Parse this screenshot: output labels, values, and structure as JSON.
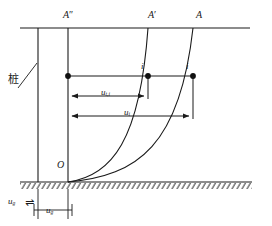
{
  "figure": {
    "colors": {
      "line": "#1a1a1a",
      "curve": "#1a1a1a",
      "dot": "#101010",
      "hatch": "#2a2a2a",
      "background": "#ffffff"
    }
  },
  "labels": {
    "pile_cjk": "桩",
    "origin": "O",
    "top_ref": {
      "base": "A",
      "prime": "″"
    },
    "top_mid": {
      "base": "A",
      "prime": "′"
    },
    "top_right": {
      "base": "A",
      "prime": ""
    },
    "node_mid": "i",
    "node_right": "i",
    "dim_t": {
      "base": "u",
      "sub": "t,i"
    },
    "dim_i": {
      "base": "u",
      "sub": "i"
    },
    "ground_left": {
      "base": "u",
      "sub": "g"
    },
    "ground_dim": {
      "base": "u",
      "sub": "g"
    },
    "ground_arrow": "⇌"
  },
  "geometry": {
    "top_line_y": 28,
    "ground_line_y": 182,
    "pile_left_x": 38,
    "ref_line_x": 68,
    "curve_mid_top_x": 148,
    "curve_right_top_x": 193,
    "node_y": 76,
    "dim_t_y": 96,
    "dim_i_y": 116,
    "ground_dim_y": 210
  }
}
